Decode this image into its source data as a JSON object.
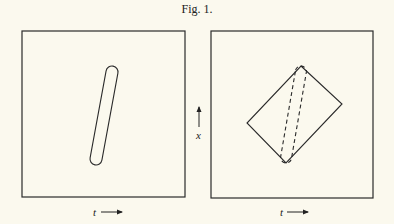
{
  "figure": {
    "title": "Fig. 1.",
    "ink_color": "#2a2a2a",
    "background": "#fbf9ee"
  },
  "panels": [
    {
      "name": "left",
      "box": {
        "x": 22,
        "y": 31,
        "w": 163,
        "h": 166
      },
      "shape": "solid capsule (elongated loop) tilted",
      "capsule": {
        "top_center": [
          112,
          72
        ],
        "bottom_center": [
          96,
          159
        ],
        "radius": 6
      },
      "t_axis_label": "t",
      "t_arrow": {
        "x": 94,
        "y": 213
      }
    },
    {
      "name": "right",
      "box": {
        "x": 211,
        "y": 31,
        "w": 162,
        "h": 167
      },
      "shape": "solid diamond with dashed capsule inside",
      "diamond": {
        "top": [
          301,
          66
        ],
        "right": [
          342,
          104
        ],
        "bottom": [
          286,
          163
        ],
        "left": [
          247,
          123
        ]
      },
      "dashed_capsule": {
        "top_center": [
          301,
          71
        ],
        "bottom_center": [
          286,
          158
        ],
        "radius": 5.5
      },
      "x_axis_label": "x",
      "x_arrow": {
        "x": 199,
        "y": 112
      },
      "t_axis_label": "t",
      "t_arrow": {
        "x": 282,
        "y": 213
      }
    }
  ],
  "labels": {
    "t_left": "t",
    "t_right": "t",
    "x_right": "x"
  }
}
